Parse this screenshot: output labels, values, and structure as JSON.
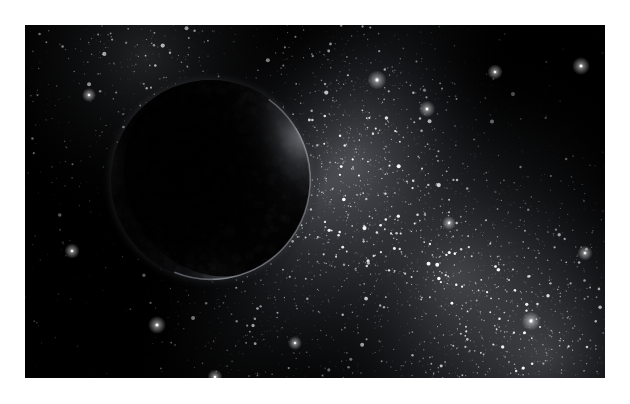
{
  "scene": {
    "title": "Rogue planet against the Milky Way",
    "kind": "astronomical-illustration",
    "canvas": {
      "width": 630,
      "height": 404
    },
    "mat": {
      "color": "#ffffff",
      "inset_left": 25,
      "inset_top": 25,
      "inset_right": 25,
      "inset_bottom": 26
    },
    "plate": {
      "x": 25,
      "y": 25,
      "width": 580,
      "height": 353,
      "background_color": "#000000"
    }
  },
  "planet": {
    "name": "rogue-planet",
    "center_x": 211,
    "center_y": 180,
    "radius": 100,
    "body_color": "#050506",
    "rim_color": "#8e8e93",
    "terminator_color": "#1b1b1e",
    "limb_highlight_angle_deg": 25,
    "crescent_band_color": "#2a2a2e",
    "description": "Large dark unlit world occupying the left-of-centre of the frame, showing a thin grey crescent rim along the upper-right, right and lower limb."
  },
  "starfield": {
    "star_count": 9000,
    "star_color": "#ffffff",
    "dim_star_color": "#b9bcc6",
    "seed": 20240517,
    "band": {
      "name": "milky-way-band",
      "color_core": "#c8cbd4",
      "color_mid": "#6e727c",
      "color_edge": "#1a1c22",
      "angle_deg": 118,
      "description": "Bright galactic band sweeping from the upper-left edge down through the centre-right and off the lower-right corner, brightest near the lower-right quadrant."
    },
    "dark_lane": {
      "name": "dark-nebula-lane",
      "color": "#000000",
      "description": "Dust lane darkening the upper-right corner and the lower-left corner of the plate."
    },
    "glow_nodes": [
      {
        "name": "glow-upper-left",
        "x": 120,
        "y": 30,
        "radius": 170,
        "intensity": 0.55
      },
      {
        "name": "glow-core-right",
        "x": 430,
        "y": 250,
        "radius": 230,
        "intensity": 1.0
      },
      {
        "name": "glow-mid",
        "x": 330,
        "y": 140,
        "radius": 170,
        "intensity": 0.62
      },
      {
        "name": "glow-lower-right",
        "x": 520,
        "y": 330,
        "radius": 180,
        "intensity": 0.78
      }
    ]
  },
  "bright_stars": [
    {
      "x": 352,
      "y": 55,
      "size": 3.0
    },
    {
      "x": 402,
      "y": 84,
      "size": 2.6
    },
    {
      "x": 470,
      "y": 47,
      "size": 2.4
    },
    {
      "x": 556,
      "y": 41,
      "size": 2.8
    },
    {
      "x": 590,
      "y": 112,
      "size": 2.2
    },
    {
      "x": 96,
      "y": 120,
      "size": 2.6
    },
    {
      "x": 64,
      "y": 70,
      "size": 2.2
    },
    {
      "x": 47,
      "y": 226,
      "size": 2.4
    },
    {
      "x": 132,
      "y": 300,
      "size": 2.8
    },
    {
      "x": 190,
      "y": 352,
      "size": 2.4
    },
    {
      "x": 270,
      "y": 318,
      "size": 2.2
    },
    {
      "x": 330,
      "y": 365,
      "size": 2.6
    },
    {
      "x": 506,
      "y": 296,
      "size": 3.0
    },
    {
      "x": 560,
      "y": 228,
      "size": 2.4
    },
    {
      "x": 424,
      "y": 198,
      "size": 2.2
    }
  ]
}
